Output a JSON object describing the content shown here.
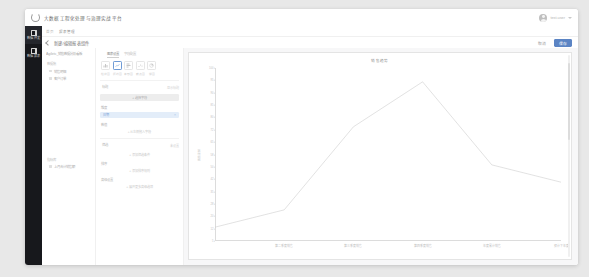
{
  "header": {
    "logo_icon": "refresh-circle-icon",
    "title": "大数据工程化处理与治理实战平台",
    "user_name": "test.user",
    "avatar_icon": "user-avatar-icon",
    "caret_icon": "chevron-down-icon"
  },
  "sidebar": {
    "items": [
      {
        "icon": "grid-dashboard-icon",
        "label": "数据\n开发",
        "active": true
      },
      {
        "icon": "chart-report-icon",
        "label": "数据\n报表",
        "active": false
      }
    ]
  },
  "breadcrumb": {
    "items": [
      "首页",
      "报表管理"
    ]
  },
  "page_bar": {
    "back_icon": "chevron-left-icon",
    "title": "新建/编辑报表组件",
    "cancel_label": "取消",
    "save_label": "保存"
  },
  "tree_panel": {
    "header": "Agiletc_销售数据分析看板",
    "groups": [
      {
        "label": "数据集",
        "items": [
          "销售明细",
          "客户订单"
        ]
      },
      {
        "label": "指标库",
        "items": [
          "上月合计销售额"
        ]
      }
    ]
  },
  "form_panel": {
    "tabs": [
      {
        "label": "图表设置",
        "active": true
      },
      {
        "label": "字段配置",
        "active": false
      }
    ],
    "chart_types": [
      {
        "icon": "bar-chart-icon",
        "label": "柱状图",
        "selected": false
      },
      {
        "icon": "line-chart-icon",
        "label": "折线图",
        "selected": true
      },
      {
        "icon": "column-chart-icon",
        "label": "条形图",
        "selected": false
      },
      {
        "icon": "scatter-chart-icon",
        "label": "散点图",
        "selected": false
      },
      {
        "icon": "pie-chart-icon",
        "label": "饼图",
        "selected": false
      }
    ],
    "sections": [
      {
        "label": "标题",
        "hint": "显示标题",
        "button_label": "+ 选择字段"
      },
      {
        "label": "维度",
        "tag_label": "日期",
        "tag_close_icon": "close-icon"
      },
      {
        "label": "数值",
        "add_label": "+ 从左侧拖入字段"
      },
      {
        "label": "筛选",
        "hint": "未设置",
        "add_label": "+ 添加筛选条件"
      },
      {
        "label": "排序",
        "add_label": "+ 添加排序规则"
      },
      {
        "label": "高级设置",
        "add_label": "+ 展开更多高级选项"
      }
    ]
  },
  "chart_data": {
    "type": "line",
    "title": "销售趋势",
    "xlabel": "",
    "ylabel": "销售金额",
    "categories": [
      "第一季度销售",
      "第二季度销售",
      "第三季度销售",
      "第四季度销售",
      "年度累计销售",
      "预计下年度"
    ],
    "values": [
      8,
      18,
      66,
      92,
      44,
      34
    ],
    "ylim": [
      0,
      100
    ],
    "ytick_labels": [
      "100",
      "95",
      "90",
      "85",
      "80",
      "72",
      "65",
      "58",
      "50",
      "42",
      "35",
      "28",
      "20",
      "12",
      "5"
    ],
    "grid": false,
    "legend": "none",
    "series_color": "#c9c9c9"
  },
  "scrollbar": {
    "name": "vertical-scrollbar"
  }
}
